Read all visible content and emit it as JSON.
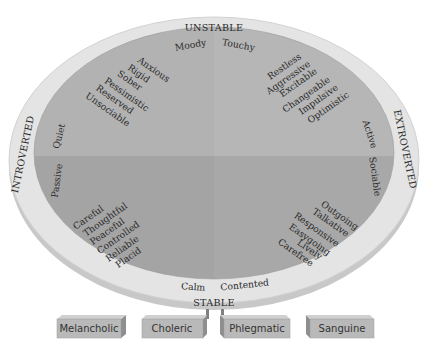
{
  "colors": {
    "rim": "#e4e4e4",
    "rim_edge": "#cfcfcf",
    "quadrant_top": "#b3b3b3",
    "quadrant_bottom": "#a3a3a3",
    "box_face": "#b9b9b9",
    "box_side": "#8e8e8e",
    "text": "#2a2a2a"
  },
  "axes": {
    "top": "UNSTABLE",
    "bottom": "STABLE",
    "left": "INTROVERTED",
    "right": "EXTROVERTED"
  },
  "inner_labels": {
    "moody": "Moody",
    "touchy": "Touchy",
    "quiet": "Quiet",
    "passive": "Passive",
    "active": "Active",
    "sociable": "Sociable",
    "calm": "Calm",
    "contented": "Contented"
  },
  "quadrants": {
    "top_left": [
      "Anxious",
      "Rigid",
      "Sober",
      "Pessimistic",
      "Reserved",
      "Unsociable"
    ],
    "top_right": [
      "Restless",
      "Aggressive",
      "Excitable",
      "Changeable",
      "Impulsive",
      "Optimistic"
    ],
    "bottom_left": [
      "Careful",
      "Thoughtful",
      "Peaceful",
      "Controlled",
      "Reliable",
      "Placid"
    ],
    "bottom_right": [
      "Outgoing",
      "Talkative",
      "Responsive",
      "Easygoing",
      "Lively",
      "Carefree"
    ]
  },
  "temperaments": [
    "Melancholic",
    "Choleric",
    "Phlegmatic",
    "Sanguine"
  ]
}
